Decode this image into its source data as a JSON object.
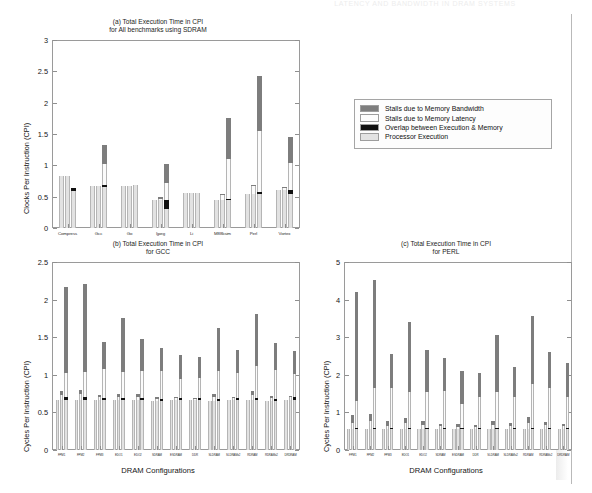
{
  "page": {
    "running_head": "LATENCY AND BANDWIDTH IN DRAM SYSTEMS",
    "background": "#ffffff"
  },
  "legend": {
    "name": "chart-legend",
    "items": [
      {
        "swatch": "sw-bw",
        "color": "#7d7d7d",
        "label": "Stalls due to Memory Bandwidth"
      },
      {
        "swatch": "sw-lat",
        "color": "#fcfcfc",
        "label": "Stalls due to Memory Latency"
      },
      {
        "swatch": "sw-ov",
        "color": "#101010",
        "label": "Overlap between Execution & Memory"
      },
      {
        "swatch": "sw-proc",
        "color": "#e3e3e3",
        "label": "Processor Execution"
      }
    ]
  },
  "chart_data": [
    {
      "id": "chart-a",
      "type": "bar",
      "title": "(a) Total Execution Time in CPI\nfor All benchmarks using SDRAM",
      "xlabel": "",
      "ylabel": "Clocks Per Instruction (CPI)",
      "ylim": [
        0,
        3
      ],
      "yticks": [
        0,
        0.5,
        1,
        1.5,
        2,
        2.5,
        3
      ],
      "ytick_labels": [
        "0",
        "0.5",
        "1",
        "1.5",
        "2",
        "2.5",
        "3"
      ],
      "grid": false,
      "legend_position": "external-right",
      "categories": [
        "Compress",
        "Gcc",
        "Go",
        "Ijpeg",
        "Li",
        "M88ksim",
        "Perl",
        "Vortex"
      ],
      "bars_per_category": 3,
      "series": [
        {
          "name": "Processor Execution",
          "color": "#e2e2e2",
          "values": [
            [
              0.83,
              0.83,
              0.59
            ],
            [
              0.67,
              0.67,
              0.65
            ],
            [
              0.67,
              0.67,
              0.68
            ],
            [
              0.45,
              0.45,
              0.31
            ],
            [
              0.56,
              0.56,
              0.56
            ],
            [
              0.44,
              0.44,
              0.44
            ],
            [
              0.55,
              0.55,
              0.55
            ],
            [
              0.61,
              0.61,
              0.55
            ]
          ]
        },
        {
          "name": "Overlap between Execution & Memory",
          "color": "#111111",
          "values": [
            [
              0.0,
              0.0,
              0.05
            ],
            [
              0.0,
              0.0,
              0.03
            ],
            [
              0.0,
              0.0,
              0.0
            ],
            [
              0.0,
              0.0,
              0.13
            ],
            [
              0.0,
              0.0,
              0.0
            ],
            [
              0.0,
              0.0,
              0.02
            ],
            [
              0.0,
              0.0,
              0.02
            ],
            [
              0.0,
              0.0,
              0.05
            ]
          ]
        },
        {
          "name": "Stalls due to Memory Latency",
          "color": "#fbfbfb",
          "values": [
            [
              0.0,
              0.0,
              0.0
            ],
            [
              0.0,
              0.0,
              0.34
            ],
            [
              0.0,
              0.0,
              0.0
            ],
            [
              0.0,
              0.02,
              0.28
            ],
            [
              0.0,
              0.0,
              0.0
            ],
            [
              0.0,
              0.09,
              0.64
            ],
            [
              0.0,
              0.12,
              0.98
            ],
            [
              0.0,
              0.03,
              0.43
            ]
          ]
        },
        {
          "name": "Stalls due to Memory Bandwidth",
          "color": "#7d7d7d",
          "values": [
            [
              0.0,
              0.0,
              0.0
            ],
            [
              0.0,
              0.0,
              0.3
            ],
            [
              0.0,
              0.0,
              0.0
            ],
            [
              0.0,
              0.02,
              0.3
            ],
            [
              0.0,
              0.0,
              0.0
            ],
            [
              0.0,
              0.01,
              0.66
            ],
            [
              0.0,
              0.02,
              0.88
            ],
            [
              0.0,
              0.02,
              0.42
            ]
          ]
        }
      ],
      "totals": [
        [
          0.83,
          0.83,
          0.83
        ],
        [
          0.67,
          0.7,
          1.32
        ],
        [
          0.67,
          0.67,
          0.68
        ],
        [
          0.45,
          0.49,
          1.02
        ],
        [
          0.56,
          0.56,
          0.56
        ],
        [
          0.44,
          0.54,
          1.75
        ],
        [
          0.55,
          0.69,
          2.43
        ],
        [
          0.61,
          0.66,
          1.45
        ]
      ]
    },
    {
      "id": "chart-b",
      "type": "bar",
      "title": "(b) Total Execution Time in CPI\nfor GCC",
      "xlabel": "DRAM Configurations",
      "ylabel": "Cycles Per Instruction (CPI)",
      "ylim": [
        0,
        2.5
      ],
      "yticks": [
        0,
        0.5,
        1,
        1.5,
        2,
        2.5
      ],
      "ytick_labels": [
        "0",
        "0.5",
        "1",
        "1.5",
        "2",
        "2.5"
      ],
      "grid": false,
      "categories": [
        "FPM1",
        "FPM2",
        "FPM3",
        "EDO1",
        "EDO2",
        "SDRAM",
        "ESDRAM",
        "DDR",
        "SLDRAM",
        "SLDRAMx2",
        "RDRAM",
        "RDRAMx2",
        "DRDRAM"
      ],
      "bars_per_category": 3,
      "series": [
        {
          "name": "Processor Execution",
          "color": "#e2e2e2",
          "values": [
            [
              0.67,
              0.67,
              0.67
            ],
            [
              0.67,
              0.67,
              0.67
            ],
            [
              0.66,
              0.66,
              0.66
            ],
            [
              0.66,
              0.66,
              0.66
            ],
            [
              0.66,
              0.66,
              0.66
            ],
            [
              0.65,
              0.65,
              0.65
            ],
            [
              0.66,
              0.66,
              0.66
            ],
            [
              0.66,
              0.66,
              0.66
            ],
            [
              0.65,
              0.65,
              0.65
            ],
            [
              0.66,
              0.66,
              0.66
            ],
            [
              0.66,
              0.66,
              0.66
            ],
            [
              0.65,
              0.65,
              0.65
            ],
            [
              0.67,
              0.67,
              0.67
            ]
          ]
        },
        {
          "name": "Overlap between Execution & Memory",
          "color": "#111111",
          "values": [
            [
              0.0,
              0.0,
              0.03
            ],
            [
              0.0,
              0.0,
              0.03
            ],
            [
              0.0,
              0.0,
              0.03
            ],
            [
              0.0,
              0.0,
              0.03
            ],
            [
              0.0,
              0.0,
              0.03
            ],
            [
              0.0,
              0.0,
              0.03
            ],
            [
              0.0,
              0.0,
              0.03
            ],
            [
              0.0,
              0.0,
              0.03
            ],
            [
              0.0,
              0.0,
              0.03
            ],
            [
              0.0,
              0.0,
              0.03
            ],
            [
              0.0,
              0.0,
              0.03
            ],
            [
              0.0,
              0.0,
              0.03
            ],
            [
              0.0,
              0.0,
              0.03
            ]
          ]
        },
        {
          "name": "Stalls due to Memory Latency",
          "color": "#fbfbfb",
          "values": [
            [
              0.0,
              0.06,
              0.33
            ],
            [
              0.0,
              0.07,
              0.34
            ],
            [
              0.0,
              0.04,
              0.39
            ],
            [
              0.0,
              0.05,
              0.35
            ],
            [
              0.0,
              0.05,
              0.36
            ],
            [
              0.0,
              0.03,
              0.37
            ],
            [
              0.0,
              0.03,
              0.26
            ],
            [
              0.0,
              0.02,
              0.27
            ],
            [
              0.0,
              0.05,
              0.37
            ],
            [
              0.0,
              0.03,
              0.34
            ],
            [
              0.0,
              0.07,
              0.43
            ],
            [
              0.0,
              0.04,
              0.38
            ],
            [
              0.0,
              0.03,
              0.31
            ]
          ]
        },
        {
          "name": "Stalls due to Memory Bandwidth",
          "color": "#7d7d7d",
          "values": [
            [
              0.0,
              0.05,
              1.14
            ],
            [
              0.0,
              0.06,
              1.17
            ],
            [
              0.0,
              0.03,
              0.36
            ],
            [
              0.0,
              0.04,
              0.72
            ],
            [
              0.0,
              0.04,
              0.43
            ],
            [
              0.0,
              0.02,
              0.31
            ],
            [
              0.0,
              0.02,
              0.31
            ],
            [
              0.0,
              0.01,
              0.28
            ],
            [
              0.0,
              0.04,
              0.57
            ],
            [
              0.0,
              0.02,
              0.3
            ],
            [
              0.0,
              0.05,
              0.69
            ],
            [
              0.0,
              0.03,
              0.36
            ],
            [
              0.0,
              0.02,
              0.31
            ]
          ]
        }
      ],
      "totals": [
        [
          0.67,
          0.78,
          2.14
        ],
        [
          0.67,
          0.8,
          2.18
        ],
        [
          0.66,
          0.73,
          1.41
        ],
        [
          0.66,
          0.75,
          1.73
        ],
        [
          0.66,
          0.75,
          1.45
        ],
        [
          0.65,
          0.7,
          1.33
        ],
        [
          0.66,
          0.71,
          1.23
        ],
        [
          0.66,
          0.69,
          1.21
        ],
        [
          0.65,
          0.74,
          1.59
        ],
        [
          0.66,
          0.71,
          1.3
        ],
        [
          0.66,
          0.78,
          1.78
        ],
        [
          0.65,
          0.72,
          1.39
        ],
        [
          0.67,
          0.72,
          1.3
        ]
      ]
    },
    {
      "id": "chart-c",
      "type": "bar",
      "title": "(c) Total Execution Time in CPI\nfor PERL",
      "xlabel": "DRAM Configurations",
      "ylabel": "Cycles Per Instruction (CPI)",
      "ylim": [
        0,
        5
      ],
      "yticks": [
        0,
        1,
        2,
        3,
        4,
        5
      ],
      "ytick_labels": [
        "0",
        "1",
        "2",
        "3",
        "4",
        "5"
      ],
      "grid": false,
      "categories": [
        "FPM1",
        "FPM2",
        "FPM3",
        "EDO1",
        "EDO2",
        "SDRAM",
        "ESDRAM",
        "DDR",
        "SLDRAM",
        "SLDRAMx2",
        "RDRAM",
        "RDRAMx2",
        "DRDRAM"
      ],
      "bars_per_category": 3,
      "series": [
        {
          "name": "Processor Execution",
          "color": "#e2e2e2",
          "values": [
            [
              0.55,
              0.55,
              0.55
            ],
            [
              0.55,
              0.55,
              0.55
            ],
            [
              0.55,
              0.55,
              0.55
            ],
            [
              0.55,
              0.55,
              0.55
            ],
            [
              0.55,
              0.55,
              0.55
            ],
            [
              0.55,
              0.55,
              0.55
            ],
            [
              0.55,
              0.55,
              0.55
            ],
            [
              0.55,
              0.55,
              0.55
            ],
            [
              0.55,
              0.55,
              0.55
            ],
            [
              0.55,
              0.55,
              0.55
            ],
            [
              0.55,
              0.55,
              0.55
            ],
            [
              0.55,
              0.55,
              0.55
            ],
            [
              0.55,
              0.55,
              0.55
            ]
          ]
        },
        {
          "name": "Overlap between Execution & Memory",
          "color": "#111111",
          "values": [
            [
              0.0,
              0.0,
              0.04
            ],
            [
              0.0,
              0.0,
              0.04
            ],
            [
              0.0,
              0.0,
              0.04
            ],
            [
              0.0,
              0.0,
              0.04
            ],
            [
              0.0,
              0.0,
              0.04
            ],
            [
              0.0,
              0.0,
              0.04
            ],
            [
              0.0,
              0.0,
              0.04
            ],
            [
              0.0,
              0.0,
              0.04
            ],
            [
              0.0,
              0.0,
              0.04
            ],
            [
              0.0,
              0.0,
              0.04
            ],
            [
              0.0,
              0.0,
              0.04
            ],
            [
              0.0,
              0.0,
              0.04
            ],
            [
              0.0,
              0.0,
              0.04
            ]
          ]
        },
        {
          "name": "Stalls due to Memory Latency",
          "color": "#fbfbfb",
          "values": [
            [
              0.0,
              0.18,
              0.71
            ],
            [
              0.0,
              0.21,
              1.07
            ],
            [
              0.0,
              0.1,
              1.05
            ],
            [
              0.0,
              0.16,
              0.95
            ],
            [
              0.0,
              0.12,
              0.95
            ],
            [
              0.0,
              0.08,
              0.99
            ],
            [
              0.0,
              0.07,
              0.63
            ],
            [
              0.0,
              0.06,
              0.81
            ],
            [
              0.0,
              0.12,
              0.95
            ],
            [
              0.0,
              0.09,
              0.83
            ],
            [
              0.0,
              0.18,
              1.17
            ],
            [
              0.0,
              0.11,
              1.06
            ],
            [
              0.0,
              0.08,
              0.82
            ]
          ]
        },
        {
          "name": "Stalls due to Memory Bandwidth",
          "color": "#7d7d7d",
          "values": [
            [
              0.0,
              0.19,
              2.89
            ],
            [
              0.0,
              0.21,
              2.87
            ],
            [
              0.0,
              0.12,
              0.91
            ],
            [
              0.0,
              0.14,
              1.87
            ],
            [
              0.0,
              0.11,
              1.12
            ],
            [
              0.0,
              0.07,
              0.88
            ],
            [
              0.0,
              0.06,
              0.89
            ],
            [
              0.0,
              0.05,
              0.65
            ],
            [
              0.0,
              0.11,
              1.52
            ],
            [
              0.0,
              0.08,
              0.79
            ],
            [
              0.0,
              0.14,
              1.8
            ],
            [
              0.0,
              0.09,
              0.96
            ],
            [
              0.0,
              0.07,
              0.9
            ]
          ]
        }
      ],
      "totals": [
        [
          0.55,
          0.92,
          4.19
        ],
        [
          0.55,
          0.96,
          4.53
        ],
        [
          0.55,
          0.77,
          2.55
        ],
        [
          0.55,
          0.85,
          3.41
        ],
        [
          0.55,
          0.78,
          2.66
        ],
        [
          0.55,
          0.7,
          2.46
        ],
        [
          0.55,
          0.68,
          2.11
        ],
        [
          0.55,
          0.66,
          2.05
        ],
        [
          0.55,
          0.78,
          3.06
        ],
        [
          0.55,
          0.72,
          2.31
        ],
        [
          0.55,
          0.87,
          3.56
        ],
        [
          0.55,
          0.75,
          2.6
        ],
        [
          0.55,
          0.7,
          2.31
        ]
      ]
    }
  ]
}
